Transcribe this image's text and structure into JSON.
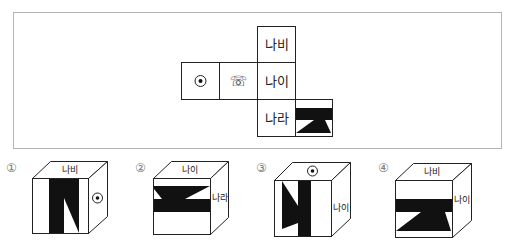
{
  "net": {
    "cells": [
      {
        "id": "top",
        "label": "나비"
      },
      {
        "id": "middle",
        "label": "나이"
      },
      {
        "id": "bottom",
        "label": "나라"
      },
      {
        "id": "left-far",
        "icon": "target-circle-icon",
        "glyph": ""
      },
      {
        "id": "left-near",
        "icon": "telephone-icon",
        "glyph": "☏"
      },
      {
        "id": "pattern",
        "icon": "black-band-triangle-pattern"
      }
    ]
  },
  "options": [
    {
      "number": "①",
      "top": "나비",
      "right_icon": "target-circle-icon",
      "right_label": ""
    },
    {
      "number": "②",
      "top": "나이",
      "right_label": "나라"
    },
    {
      "number": "③",
      "top_icon": "target-circle-icon",
      "top": "",
      "right_label": "나이"
    },
    {
      "number": "④",
      "top": "나비",
      "right_label": "나이"
    }
  ],
  "colors": {
    "ink": "#111111",
    "frame": "#b5b5b5"
  }
}
